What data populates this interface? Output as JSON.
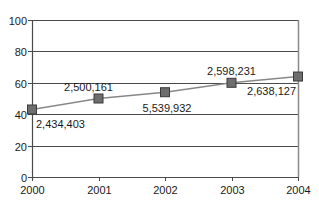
{
  "chart_data": {
    "type": "line",
    "title": "",
    "xlabel": "",
    "ylabel": "",
    "categories": [
      "2000",
      "2001",
      "2002",
      "2003",
      "2004"
    ],
    "series": [
      {
        "name": "Series 1",
        "values": [
          43,
          50,
          54,
          60,
          64
        ],
        "data_labels": [
          "2,434,403",
          "2,500,161",
          "5,539,932",
          "2,598,231",
          "2,638,127"
        ],
        "color": "#888888",
        "marker": "square",
        "marker_color": "#6e6e6e"
      }
    ],
    "ylim": [
      0,
      100
    ],
    "yticks": [
      "0",
      "20",
      "40",
      "60",
      "80",
      "100"
    ],
    "grid": true,
    "legend": "none"
  },
  "colors": {
    "gridline": "#4a4a4a",
    "axis": "#4a4a4a",
    "plot_border": "#8a8a8a",
    "line": "#888888",
    "marker_fill": "#6e6e6e",
    "marker_stroke": "#3a3a3a"
  }
}
